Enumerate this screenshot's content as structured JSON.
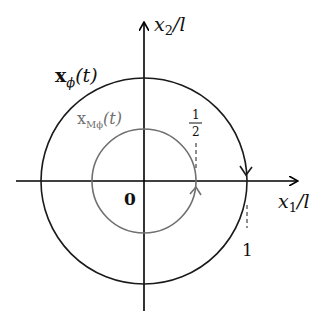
{
  "diagram": {
    "title": "",
    "colors": {
      "outer_circle": "#1a1a1a",
      "inner_circle": "#707070",
      "axes": "#000000",
      "inner_label": "#707070",
      "text": "#111111"
    },
    "axes": {
      "x_label_var": "x",
      "x_label_sub": "1",
      "x_label_suffix": "/l",
      "y_label_var": "x",
      "y_label_sub": "2",
      "y_label_suffix": "/l",
      "origin_label": "0"
    },
    "curves": {
      "outer": {
        "label_main": "x",
        "label_sub": "ϕ",
        "label_arg": "(t)",
        "radius_label": "1",
        "direction": "clockwise"
      },
      "inner": {
        "label_main": "x",
        "label_sub": "Mϕ",
        "label_arg": "(t)",
        "radius_label_num": "1",
        "radius_label_den": "2",
        "direction": "counterclockwise"
      }
    }
  }
}
